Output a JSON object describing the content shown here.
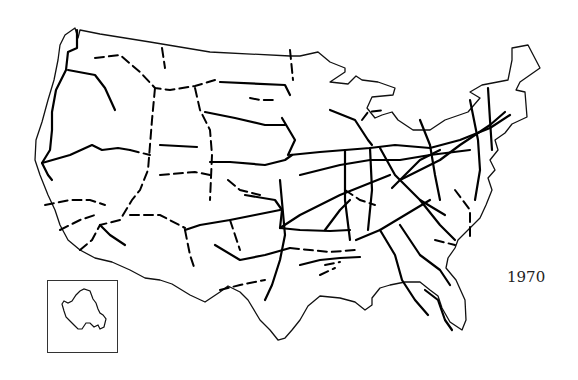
{
  "map": {
    "subject": "Interstate highway system of the contiguous United States",
    "year_label": "1970",
    "inset": {
      "label": "Hawaii (Oahu) inset"
    },
    "colors": {
      "background": "#ffffff",
      "lines": "#000000"
    },
    "legend": {
      "solid_line": "completed highway",
      "dashed_line": "uncompleted segment"
    }
  }
}
